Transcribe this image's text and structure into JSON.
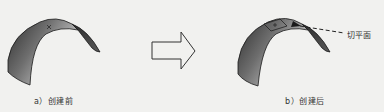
{
  "figure": {
    "panel_a": {
      "caption": "a）创建前"
    },
    "panel_b": {
      "caption": "b）创建后",
      "callout": "切平面"
    },
    "arrow": {
      "direction": "right"
    }
  },
  "colors": {
    "background": "#f1f1ef",
    "surface_dark": "#3a3a3a",
    "surface_mid": "#7a7a7a",
    "surface_light": "#b5b5b5",
    "outline": "#1a1a1a"
  }
}
